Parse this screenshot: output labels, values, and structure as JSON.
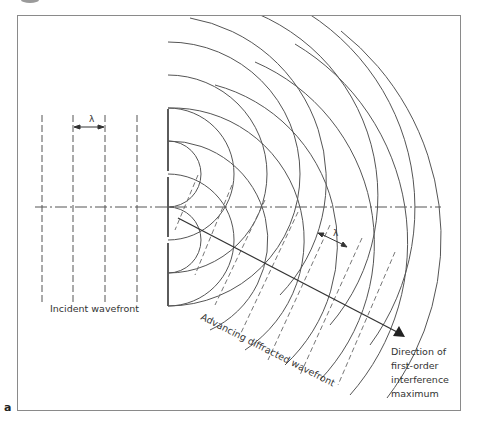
{
  "figure": {
    "panel_label": "a",
    "frame_color": "#8a8a8a",
    "line_color": "#4a4a4a"
  },
  "labels": {
    "wavelength_incident": "λ",
    "wavelength_diffracted": "λ",
    "incident_wavefront": "Incident wavefront",
    "advancing_wavefront": "Advancing diffracted wavefront",
    "direction_line1": "Direction of",
    "direction_line2": "first-order",
    "direction_line3": "interference",
    "direction_line4": "maximum"
  },
  "geometry": {
    "incident_lines_x": [
      42,
      73,
      105,
      137
    ],
    "barrier_x": 168,
    "sources_y": [
      174,
      240
    ],
    "arc_spacing": 33,
    "axis_y": 207
  }
}
